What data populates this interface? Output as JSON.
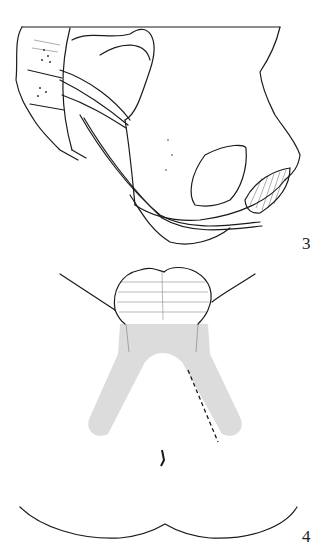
{
  "figures": [
    {
      "id": "figure-3",
      "label": "3",
      "description": "Lateral view of pelvic bone with sacrum, ligaments and nerve"
    },
    {
      "id": "figure-4",
      "label": "4",
      "description": "Posterior/perineal view with shaded V-shaped region and dashed incision line"
    }
  ],
  "colors": {
    "ink": "#1a1a1a",
    "shade": "#dcdcdc",
    "background": "#ffffff"
  }
}
